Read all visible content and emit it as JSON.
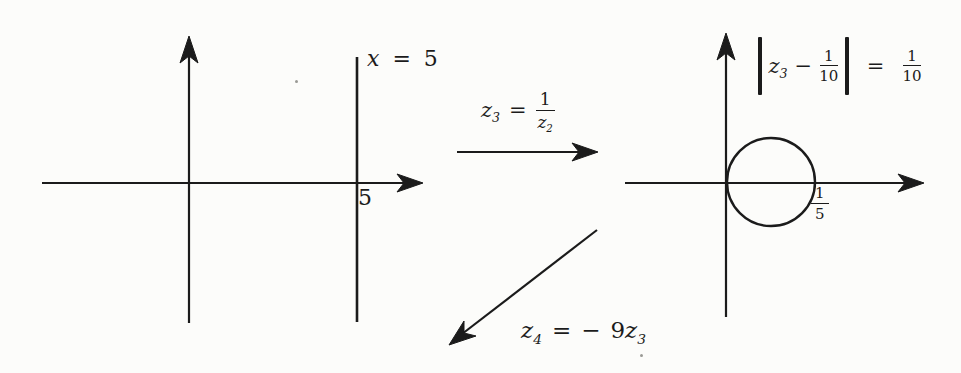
{
  "colors": {
    "ink": "#1b1b1b",
    "background": "#fcfcfa"
  },
  "left_plot": {
    "line_equation": {
      "variable": "x",
      "equals": "=",
      "value": "5"
    },
    "x_tick": "5"
  },
  "transform_arrow_right": {
    "lhs_base": "z",
    "lhs_sub": "3",
    "equals": "=",
    "frac_numerator": "1",
    "frac_den_base": "z",
    "frac_den_sub": "2"
  },
  "right_plot": {
    "circle_equation": {
      "abs_base": "z",
      "abs_sub": "3",
      "minus": "−",
      "inner_frac_num": "1",
      "inner_frac_den": "10",
      "equals": "=",
      "rhs_frac_num": "1",
      "rhs_frac_den": "10"
    },
    "x_tick_num": "1",
    "x_tick_den": "5"
  },
  "transform_arrow_down": {
    "lhs_base": "z",
    "lhs_sub": "4",
    "equals": "=",
    "rhs_minus": "−",
    "rhs_coeff": "9",
    "rhs_base": "z",
    "rhs_sub": "3"
  }
}
